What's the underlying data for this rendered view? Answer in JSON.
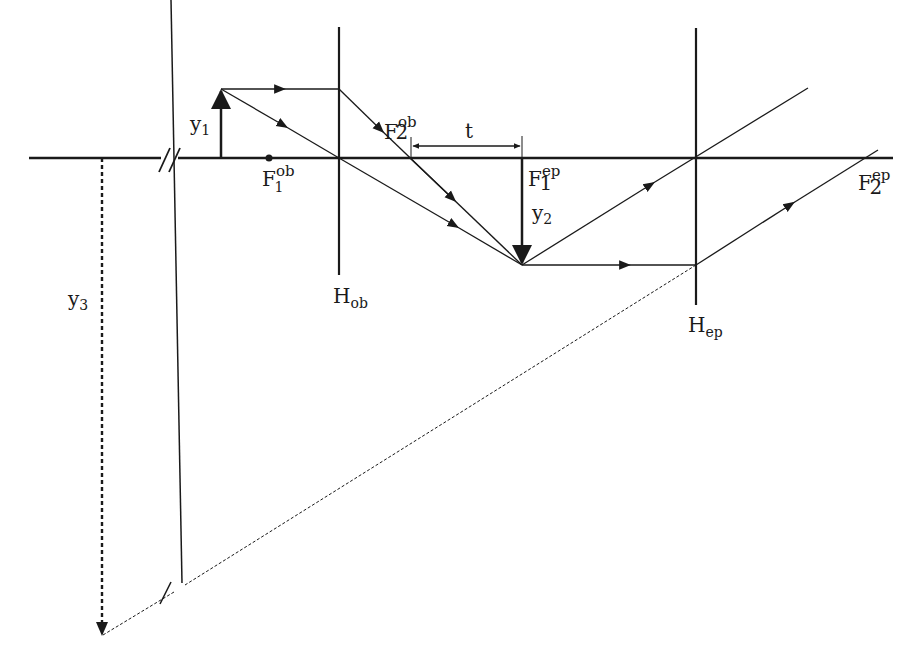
{
  "colors": {
    "ink": "#1a1a1a",
    "background": "#ffffff"
  },
  "labels": {
    "y1": {
      "main": "y",
      "sub": "1"
    },
    "y2": {
      "main": "y",
      "sub": "2"
    },
    "y3": {
      "main": "y",
      "sub": "3"
    },
    "t": "t",
    "F1ob": {
      "main": "F",
      "sub": "1",
      "sup": "ob"
    },
    "F2ob": {
      "main": "F",
      "sub": "2",
      "sup": "ob"
    },
    "F1ep": {
      "main": "F",
      "sub": "1",
      "sup": "ep"
    },
    "F2ep": {
      "main": "F",
      "sub": "2",
      "sup": "ep"
    },
    "Hob": {
      "main": "H",
      "sub": "ob"
    },
    "Hep": {
      "main": "H",
      "sub": "ep"
    }
  },
  "geometry": {
    "axis": {
      "x1": 29,
      "x2": 893,
      "y": 158
    },
    "objective_lens": {
      "x": 339,
      "y_top": 27,
      "y_bottom": 275
    },
    "eyepiece_lens": {
      "x": 696,
      "y_top": 28,
      "y_bottom": 305
    },
    "object_arrow_y1": {
      "x": 221,
      "y_base": 158,
      "y_tip": 89
    },
    "image_arrow_y2": {
      "x": 522,
      "y_base": 158,
      "y_tip": 265
    },
    "virtual_image_y3": {
      "x": 102,
      "y_base": 158,
      "y_tip": 635
    },
    "focal_points": {
      "F1ob_x": 269,
      "F2ob_x": 410,
      "F1ep_x": 522
    }
  }
}
